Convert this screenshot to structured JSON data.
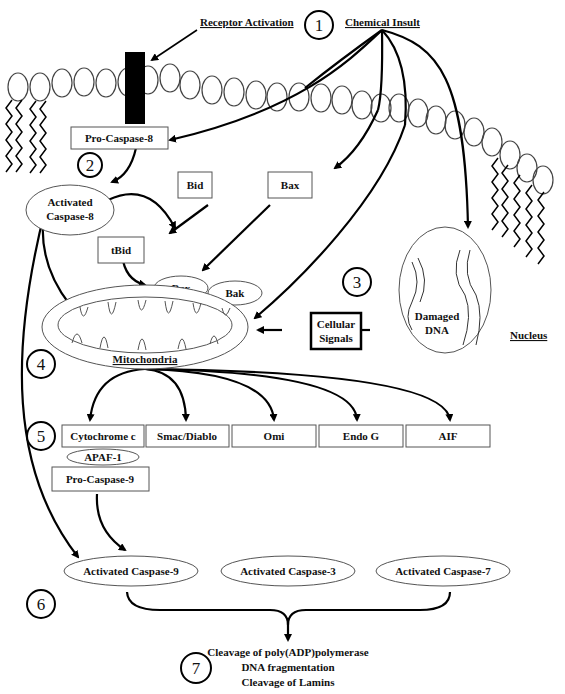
{
  "figure": {
    "steps": {
      "s1": "1",
      "s2": "2",
      "s3": "3",
      "s4": "4",
      "s5": "5",
      "s6": "6",
      "s7": "7"
    },
    "labels": {
      "receptor_activation": "Receptor Activation",
      "chemical_insult": "Chemical Insult",
      "nucleus": "Nucleus",
      "mitochondria": "Mitochondria",
      "damaged_dna_1": "Damaged",
      "damaged_dna_2": "DNA"
    },
    "boxes": {
      "pro_caspase_8": "Pro-Caspase-8",
      "bid": "Bid",
      "bax_top": "Bax",
      "tbid": "tBid",
      "cellular_signals_1": "Cellular",
      "cellular_signals_2": "Signals",
      "pro_caspase_9": "Pro-Caspase-9"
    },
    "ellipses": {
      "activated_caspase_8_1": "Activated",
      "activated_caspase_8_2": "Caspase-8",
      "bax": "Bax",
      "bak": "Bak",
      "apaf1": "APAF-1"
    },
    "mito_factors": [
      "Cytochrome c",
      "Smac/Diablo",
      "Omi",
      "Endo G",
      "AIF"
    ],
    "activated_caspases": [
      "Activated Caspase-9",
      "Activated Caspase-3",
      "Activated Caspase-7"
    ],
    "outcomes": [
      "Cleavage of poly(ADP)polymerase",
      "DNA fragmentation",
      "Cleavage of Lamins"
    ]
  }
}
